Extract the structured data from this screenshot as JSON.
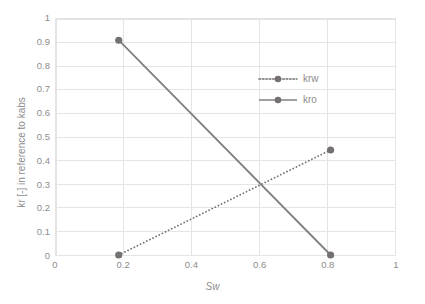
{
  "chart_data": {
    "type": "line",
    "title": "",
    "xlabel": "Sw",
    "ylabel": "kr [-] in reference to kabs",
    "xlim": [
      0,
      1
    ],
    "ylim": [
      0,
      1
    ],
    "xticks": [
      "0",
      "0.2",
      "0.4",
      "0.6",
      "0.8",
      "1"
    ],
    "xtick_values": [
      0,
      0.2,
      0.4,
      0.6,
      0.8,
      1
    ],
    "yticks": [
      "0",
      "0.1",
      "0.2",
      "0.3",
      "0.4",
      "0.5",
      "0.6",
      "0.7",
      "0.8",
      "0.9",
      "1"
    ],
    "ytick_values": [
      0,
      0.1,
      0.2,
      0.3,
      0.4,
      0.5,
      0.6,
      0.7,
      0.8,
      0.9,
      1
    ],
    "grid": true,
    "grid_color": "#e4e4e4",
    "legend_position": "inside-upper-right",
    "series": [
      {
        "name": "krw",
        "line_style": "dotted",
        "color": "#767171",
        "marker": "circle",
        "x": [
          0.185,
          0.81
        ],
        "values": [
          0,
          0.445
        ]
      },
      {
        "name": "kro",
        "line_style": "solid",
        "color": "#808080",
        "marker": "circle",
        "x": [
          0.185,
          0.81
        ],
        "values": [
          0.91,
          0
        ]
      }
    ]
  },
  "legend": {
    "items": [
      {
        "label": "krw"
      },
      {
        "label": "kro"
      }
    ]
  },
  "axes": {
    "x_title": "Sw",
    "y_title": "kr [-] in reference to kabs"
  }
}
